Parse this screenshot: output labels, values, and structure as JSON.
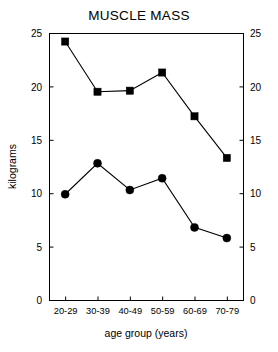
{
  "chart_data": {
    "type": "line",
    "title": "MUSCLE MASS",
    "xlabel": "age group (years)",
    "ylabel": "kilograms",
    "categories": [
      "20-29",
      "30-39",
      "40-49",
      "50-59",
      "60-69",
      "70-79"
    ],
    "ylim": [
      0,
      25
    ],
    "yticks": [
      "0",
      "5",
      "10",
      "15",
      "20",
      "25"
    ],
    "ytick_values": [
      0,
      5,
      10,
      15,
      20,
      25
    ],
    "grid": false,
    "legend": "none",
    "right_axis_mirrored": true,
    "right_yticks": [
      "0",
      "5",
      "10",
      "15",
      "20",
      "25"
    ],
    "series": [
      {
        "name": "square-series",
        "marker": "square",
        "color": "#000000",
        "values": [
          24.2,
          19.5,
          19.6,
          21.3,
          17.2,
          13.3
        ]
      },
      {
        "name": "circle-series",
        "marker": "circle",
        "color": "#000000",
        "values": [
          9.9,
          12.8,
          10.3,
          11.4,
          6.8,
          5.8
        ]
      }
    ]
  }
}
